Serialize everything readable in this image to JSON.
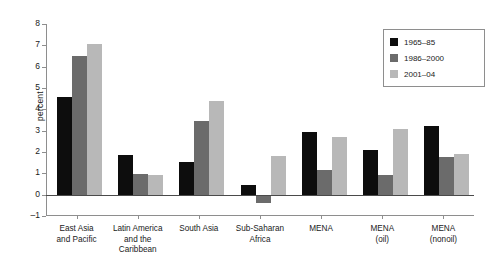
{
  "chart_data": {
    "type": "bar",
    "title": "",
    "xlabel": "",
    "ylabel": "percent",
    "ylim": [
      -1,
      8
    ],
    "yticks": [
      -1,
      0,
      1,
      2,
      3,
      4,
      5,
      6,
      7,
      8
    ],
    "grid": false,
    "legend_position": "top-right",
    "categories": [
      "East Asia and Pacific",
      "Latin America and the Caribbean",
      "South Asia",
      "Sub-Saharan Africa",
      "MENA",
      "MENA (oil)",
      "MENA (nonoil)"
    ],
    "category_lines": [
      [
        "East Asia",
        "and Pacific"
      ],
      [
        "Latin America",
        "and the",
        "Caribbean"
      ],
      [
        "South Asia"
      ],
      [
        "Sub-Saharan",
        "Africa"
      ],
      [
        "MENA"
      ],
      [
        "MENA",
        "(oil)"
      ],
      [
        "MENA",
        "(nonoil)"
      ]
    ],
    "series": [
      {
        "name": "1965–85",
        "color": "#0d0d0d",
        "values": [
          4.6,
          1.85,
          1.55,
          0.45,
          2.95,
          2.1,
          3.2
        ]
      },
      {
        "name": "1986–2000",
        "color": "#6b6b6b",
        "values": [
          6.5,
          0.95,
          3.45,
          -0.4,
          1.15,
          0.9,
          1.75
        ]
      },
      {
        "name": "2001–04",
        "color": "#b8b8b8",
        "values": [
          7.05,
          0.9,
          4.4,
          1.8,
          2.7,
          3.1,
          1.9
        ]
      }
    ]
  }
}
